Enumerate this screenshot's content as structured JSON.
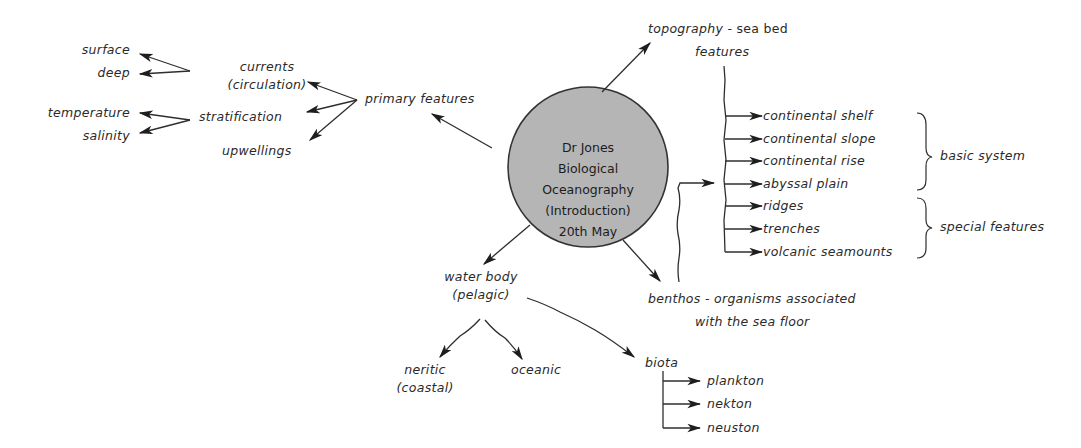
{
  "hub": {
    "line1": "Dr Jones",
    "line2": "Biological",
    "line3": "Oceanography",
    "line4": "(Introduction)",
    "line5": "20th May",
    "fill": "#b8b8b8",
    "stroke": "#333333"
  },
  "primary": {
    "label": "primary features",
    "currents": {
      "line1": "currents",
      "line2": "(circulation)",
      "children": [
        "surface",
        "deep"
      ]
    },
    "stratification": {
      "label": "stratification",
      "children": [
        "temperature",
        "salinity"
      ]
    },
    "upwellings": {
      "label": "upwellings"
    }
  },
  "topography": {
    "title": "topography",
    "suffix": " - sea bed",
    "line2": "features",
    "items": [
      "continental shelf",
      "continental slope",
      "continental rise",
      "abyssal plain",
      "ridges",
      "trenches",
      "volcanic seamounts"
    ],
    "groups": {
      "basic": "basic system",
      "special": "special features"
    }
  },
  "benthos": {
    "title": "benthos",
    "suffix": " - organisms associated",
    "line2": "with the sea floor"
  },
  "water_body": {
    "line1": "water body",
    "line2": "(pelagic)",
    "neritic": {
      "line1": "neritic",
      "line2": "(coastal)"
    },
    "oceanic": "oceanic",
    "biota": {
      "label": "biota",
      "items": [
        "plankton",
        "nekton",
        "neuston"
      ]
    }
  },
  "colors": {
    "ink": "#2a2a2a",
    "paper": "#ffffff"
  }
}
